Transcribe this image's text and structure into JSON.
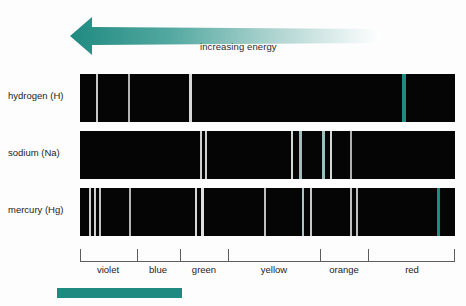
{
  "figure": {
    "background": "#fdfdfd",
    "width": 466,
    "height": 306
  },
  "arrow": {
    "label": "increasing energy",
    "direction": "left",
    "color_start": "#1f8a80",
    "color_end": "#ffffff"
  },
  "axis": {
    "line_color": "#5d5d5d",
    "ticks_px": [
      0,
      57,
      100,
      148,
      240,
      288,
      375
    ],
    "bands": [
      {
        "name": "violet",
        "center_px": 28
      },
      {
        "name": "blue",
        "center_px": 78
      },
      {
        "name": "green",
        "center_px": 124
      },
      {
        "name": "yellow",
        "center_px": 194
      },
      {
        "name": "orange",
        "center_px": 264
      },
      {
        "name": "red",
        "center_px": 332
      }
    ]
  },
  "swatch": {
    "color": "#1f8a80"
  },
  "spectra": [
    {
      "label": "hydrogen (H)",
      "top_px": 74,
      "background": "#050505",
      "lines": [
        {
          "x_px": 16,
          "width_px": 2,
          "color": "#c8c8c8",
          "band": "violet"
        },
        {
          "x_px": 48,
          "width_px": 2,
          "color": "#b4b4b4",
          "band": "violet"
        },
        {
          "x_px": 109,
          "width_px": 3,
          "color": "#d8d8d8",
          "band": "green"
        },
        {
          "x_px": 322,
          "width_px": 4,
          "color": "#1f8a80",
          "band": "red"
        }
      ]
    },
    {
      "label": "sodium (Na)",
      "top_px": 131,
      "background": "#050505",
      "lines": [
        {
          "x_px": 120,
          "width_px": 2,
          "color": "#cfcfcf",
          "band": "green"
        },
        {
          "x_px": 125,
          "width_px": 2,
          "color": "#cfcfcf",
          "band": "green"
        },
        {
          "x_px": 211,
          "width_px": 2,
          "color": "#d6d6d6",
          "band": "orange"
        },
        {
          "x_px": 219,
          "width_px": 3,
          "color": "#9dbfbc",
          "band": "orange"
        },
        {
          "x_px": 242,
          "width_px": 3,
          "color": "#9dbfbc",
          "band": "orange"
        },
        {
          "x_px": 250,
          "width_px": 2,
          "color": "#d6d6d6",
          "band": "orange"
        },
        {
          "x_px": 270,
          "width_px": 2,
          "color": "#b0b0b0",
          "band": "orange"
        }
      ]
    },
    {
      "label": "mercury (Hg)",
      "top_px": 188,
      "background": "#050505",
      "lines": [
        {
          "x_px": 9,
          "width_px": 2,
          "color": "#d0d0d0",
          "band": "violet"
        },
        {
          "x_px": 14,
          "width_px": 2,
          "color": "#d0d0d0",
          "band": "violet"
        },
        {
          "x_px": 19,
          "width_px": 2,
          "color": "#c4c4c4",
          "band": "violet"
        },
        {
          "x_px": 49,
          "width_px": 2,
          "color": "#b4b4b4",
          "band": "blue"
        },
        {
          "x_px": 115,
          "width_px": 2,
          "color": "#d8d8d8",
          "band": "green"
        },
        {
          "x_px": 121,
          "width_px": 3,
          "color": "#e0e0e0",
          "band": "green"
        },
        {
          "x_px": 184,
          "width_px": 2,
          "color": "#c0c0c0",
          "band": "yellow"
        },
        {
          "x_px": 222,
          "width_px": 2,
          "color": "#a9c6c3",
          "band": "orange"
        },
        {
          "x_px": 230,
          "width_px": 2,
          "color": "#c8c8c8",
          "band": "orange"
        },
        {
          "x_px": 270,
          "width_px": 2,
          "color": "#c0c0c0",
          "band": "orange"
        },
        {
          "x_px": 276,
          "width_px": 2,
          "color": "#c0c0c0",
          "band": "orange"
        },
        {
          "x_px": 357,
          "width_px": 3,
          "color": "#1f8a80",
          "band": "red"
        }
      ]
    }
  ],
  "chart_data": {
    "type": "table",
    "xlabel": "visible spectrum (violet → red)",
    "ylabel": "",
    "annotations": [
      "increasing energy"
    ],
    "legend": [
      "hydrogen (H)",
      "sodium (Na)",
      "mercury (Hg)"
    ],
    "categories": [
      "violet",
      "blue",
      "green",
      "yellow",
      "orange",
      "red"
    ],
    "series": [
      {
        "name": "hydrogen (H)",
        "line_positions": [
          16,
          48,
          109,
          322
        ]
      },
      {
        "name": "sodium (Na)",
        "line_positions": [
          120,
          125,
          211,
          219,
          242,
          250,
          270
        ]
      },
      {
        "name": "mercury (Hg)",
        "line_positions": [
          9,
          14,
          19,
          49,
          115,
          121,
          184,
          222,
          230,
          270,
          276,
          357
        ]
      }
    ],
    "xlim": [
      0,
      375
    ],
    "grid": false
  }
}
